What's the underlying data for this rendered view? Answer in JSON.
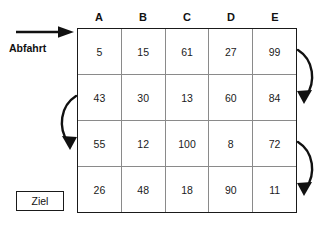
{
  "diagram": {
    "title_label": "Abfahrt",
    "goal_label": "Ziel",
    "start_arrow_icon": "arrow-right-icon",
    "curve_arrow_icon": "curved-arrow-icon",
    "colors": {
      "ink": "#1a1a1a",
      "grid_line": "#8a8a8a",
      "background": "#ffffff"
    },
    "columns": [
      "A",
      "B",
      "C",
      "D",
      "E"
    ],
    "rows": [
      {
        "cells": [
          "5",
          "15",
          "61",
          "27",
          "99"
        ]
      },
      {
        "cells": [
          "43",
          "30",
          "13",
          "60",
          "84"
        ]
      },
      {
        "cells": [
          "55",
          "12",
          "100",
          "8",
          "72"
        ]
      },
      {
        "cells": [
          "26",
          "48",
          "18",
          "90",
          "11"
        ]
      }
    ],
    "flow_arrows": [
      {
        "name": "turn-right-row1-to-row2",
        "side": "right",
        "from_row": 1,
        "to_row": 2
      },
      {
        "name": "turn-left-row2-to-row3",
        "side": "left",
        "from_row": 2,
        "to_row": 3
      },
      {
        "name": "turn-right-row3-to-row4",
        "side": "right",
        "from_row": 3,
        "to_row": 4
      }
    ]
  }
}
